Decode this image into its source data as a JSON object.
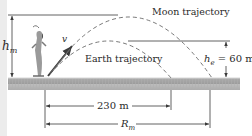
{
  "diagram": {
    "labels": {
      "moon_trajectory": "Moon trajectory",
      "earth_trajectory": "Earth trajectory",
      "h_m_main": "h",
      "h_m_sub": "m",
      "h_e_main": "h",
      "h_e_sub": "e",
      "h_e_value": " = 60 m",
      "velocity": "v",
      "earth_range": "230 m",
      "moon_range_main": "R",
      "moon_range_sub": "m"
    },
    "colors": {
      "line": "#3a3a3a",
      "ground": "#a8a8a8",
      "ground_top": "#c8c8c8",
      "dashed": "#555555",
      "background": "#ffffff",
      "strip": "#ececec"
    }
  }
}
